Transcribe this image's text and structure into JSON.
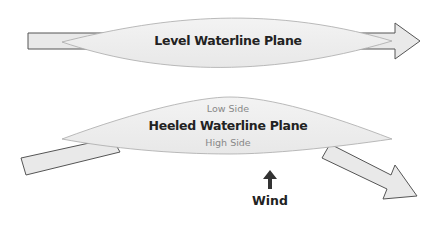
{
  "diagram": {
    "level": {
      "label": "Level Waterline Plane"
    },
    "heeled": {
      "label": "Heeled Waterline Plane",
      "low_side": "Low Side",
      "high_side": "High Side"
    },
    "wind": {
      "label": "Wind",
      "icon": "up-arrow-icon"
    },
    "colors": {
      "fill": "#ebebeb",
      "stroke": "#555555",
      "lens_stroke": "#aaaaaa",
      "text": "#222222",
      "muted_text": "#888888"
    }
  }
}
